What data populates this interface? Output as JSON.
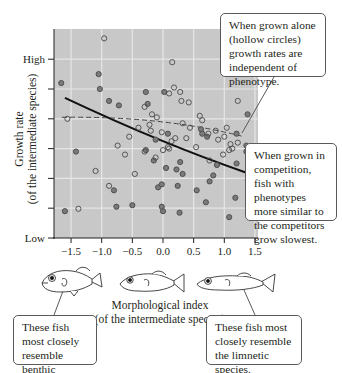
{
  "chart_data": {
    "type": "scatter",
    "title": "",
    "xlabel": "Morphological index",
    "xlabel_sub": "(of the intermediate species)",
    "ylabel": "Growth rate",
    "ylabel_sub": "(of the intermediate species)",
    "xlim": [
      -1.8,
      1.55
    ],
    "ylim": [
      0,
      7
    ],
    "x_ticks": [
      -1.5,
      -1.0,
      -0.5,
      0.0,
      0.5,
      1.0,
      1.5
    ],
    "x_tick_labels": [
      "−1.5",
      "−1.0",
      "−0.5",
      "0.0",
      "0.5",
      "1.0",
      "1.5"
    ],
    "y_ticks": [
      0,
      1,
      2,
      3,
      4,
      5,
      6
    ],
    "y_tick_labels": [
      "Low",
      "",
      "",
      "",
      "",
      "",
      "High"
    ],
    "grid": true,
    "background": "#c8c8c8",
    "grid_color": "#e6e6e6",
    "series": [
      {
        "name": "Grown in competition (filled circles)",
        "marker": "filled",
        "color": "#7a7a7a",
        "points": [
          [
            -1.66,
            5.2
          ],
          [
            -1.05,
            5.5
          ],
          [
            -1.03,
            5.0
          ],
          [
            -0.88,
            4.6
          ],
          [
            -0.72,
            4.45
          ],
          [
            -1.42,
            2.9
          ],
          [
            -0.8,
            1.6
          ],
          [
            -0.76,
            1.05
          ],
          [
            -1.6,
            0.9
          ],
          [
            -0.5,
            1.1
          ],
          [
            -0.28,
            4.9
          ],
          [
            -0.25,
            4.5
          ],
          [
            -0.15,
            2.6
          ],
          [
            -0.08,
            1.7
          ],
          [
            0.0,
            0.9
          ],
          [
            -0.02,
            1.05
          ],
          [
            -0.28,
            2.95
          ],
          [
            0.02,
            4.9
          ],
          [
            0.08,
            3.5
          ],
          [
            -0.12,
            3.3
          ],
          [
            0.22,
            2.3
          ],
          [
            0.24,
            1.75
          ],
          [
            0.28,
            2.55
          ],
          [
            0.32,
            2.15
          ],
          [
            0.27,
            0.85
          ],
          [
            0.55,
            1.6
          ],
          [
            0.62,
            3.65
          ],
          [
            0.64,
            3.5
          ],
          [
            0.76,
            1.9
          ],
          [
            0.7,
            1.2
          ],
          [
            0.82,
            2.1
          ],
          [
            0.88,
            2.45
          ],
          [
            1.08,
            0.7
          ],
          [
            1.2,
            2.5
          ],
          [
            1.36,
            3.1
          ],
          [
            1.38,
            4.15
          ],
          [
            1.36,
            2.9
          ],
          [
            1.2,
            3.5
          ],
          [
            0.72,
            3.4
          ],
          [
            1.18,
            1.35
          ],
          [
            0.05,
            2.35
          ],
          [
            -0.02,
            1.8
          ]
        ]
      },
      {
        "name": "Grown alone (hollow circles)",
        "marker": "hollow",
        "color": "#5a5a5a",
        "points": [
          [
            -1.56,
            4.0
          ],
          [
            -0.96,
            6.7
          ],
          [
            -0.74,
            3.1
          ],
          [
            -1.1,
            2.25
          ],
          [
            -0.88,
            1.75
          ],
          [
            -0.55,
            3.4
          ],
          [
            -0.62,
            2.8
          ],
          [
            -0.4,
            3.7
          ],
          [
            -0.46,
            2.15
          ],
          [
            -0.3,
            4.4
          ],
          [
            -0.18,
            4.15
          ],
          [
            -0.1,
            4.05
          ],
          [
            -0.2,
            3.6
          ],
          [
            -0.02,
            3.55
          ],
          [
            -0.12,
            2.7
          ],
          [
            0.0,
            2.95
          ],
          [
            0.08,
            3.05
          ],
          [
            0.14,
            3.25
          ],
          [
            0.1,
            3.0
          ],
          [
            0.2,
            3.35
          ],
          [
            0.15,
            5.9
          ],
          [
            0.18,
            5.05
          ],
          [
            0.1,
            4.85
          ],
          [
            0.28,
            4.9
          ],
          [
            0.3,
            4.6
          ],
          [
            0.32,
            3.85
          ],
          [
            0.42,
            4.55
          ],
          [
            0.44,
            3.7
          ],
          [
            0.54,
            3.05
          ],
          [
            0.6,
            4.1
          ],
          [
            0.64,
            3.95
          ],
          [
            0.74,
            3.5
          ],
          [
            0.86,
            3.6
          ],
          [
            0.9,
            3.3
          ],
          [
            1.04,
            3.7
          ],
          [
            1.1,
            3.15
          ],
          [
            1.13,
            3.0
          ],
          [
            1.08,
            2.95
          ],
          [
            1.22,
            3.2
          ],
          [
            1.3,
            5.5
          ],
          [
            1.22,
            4.6
          ],
          [
            0.98,
            2.8
          ],
          [
            1.0,
            3.4
          ],
          [
            -1.38,
            0.98
          ],
          [
            -0.3,
            2.9
          ],
          [
            -0.22,
            3.8
          ],
          [
            0.38,
            3.35
          ],
          [
            0.76,
            2.6
          ]
        ]
      }
    ],
    "fit_lines": [
      {
        "name": "Competition regression",
        "style": "solid",
        "color": "#111111",
        "from": [
          -1.6,
          4.7
        ],
        "to": [
          1.35,
          2.2
        ]
      },
      {
        "name": "Alone regression",
        "style": "dashed",
        "color": "#444444",
        "from": [
          -1.65,
          4.05
        ],
        "to": [
          1.32,
          3.4
        ],
        "curve_mid": [
          0.0,
          4.05
        ]
      }
    ],
    "annotations": [
      "When grown alone (hollow circles) growth rates are independent of phenotype.",
      "When grown in competition, fish with phenotypes more similar to the competitors grow slowest.",
      "These fish most closely resemble benthic species.",
      "These fish most closely resemble the limnetic species."
    ]
  },
  "callouts": {
    "alone": "When grown alone (hollow circles) growth rates are independent of phenotype.",
    "competition": "When grown in competition, fish with phenotypes more similar to the competitors grow slowest.",
    "benthic": "These fish most closely resemble benthic species.",
    "limnetic": "These fish most closely resemble the limnetic species."
  },
  "fish": [
    {
      "label": "benthic-fish",
      "position": "left"
    },
    {
      "label": "intermediate-fish",
      "position": "center"
    },
    {
      "label": "limnetic-fish",
      "position": "right"
    }
  ]
}
